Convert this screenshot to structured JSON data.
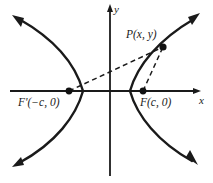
{
  "figure": {
    "kind": "hyperbola-focus-diagram",
    "background_color": "#ffffff",
    "stroke_color": "#1a1a1a",
    "axes": {
      "x_label": "x",
      "y_label": "y",
      "origin": {
        "x": 110,
        "y": 91
      },
      "x_axis": {
        "x_start": 10,
        "x_end": 200,
        "y": 91,
        "arrow": "right"
      },
      "y_axis": {
        "y_start": 5,
        "y_end": 176,
        "x": 110,
        "arrow": "up"
      }
    },
    "points": [
      {
        "id": "focus-left",
        "label": "F'(−c, 0)",
        "x": 69,
        "y": 91,
        "dot": true
      },
      {
        "id": "focus-right",
        "label": "F(c, 0)",
        "x": 143,
        "y": 91,
        "dot": true
      },
      {
        "id": "point-p",
        "label": "P(x, y)",
        "x": 163,
        "y": 47,
        "dot": true
      }
    ],
    "curves": [
      {
        "id": "left-branch",
        "vertex": {
          "x": 83,
          "y": 91
        },
        "arrow_tips": [
          {
            "x": 13,
            "y": 16
          },
          {
            "x": 13,
            "y": 166
          }
        ]
      },
      {
        "id": "right-branch",
        "vertex": {
          "x": 130,
          "y": 91
        },
        "arrow_tips": [
          {
            "x": 199,
            "y": 14
          },
          {
            "x": 197,
            "y": 164
          }
        ]
      }
    ],
    "segments": [
      {
        "id": "focal-radius-left",
        "from": "focus-left",
        "to": "point-p",
        "style": "dashed"
      },
      {
        "id": "focal-radius-right",
        "from": "focus-right",
        "to": "point-p",
        "style": "dashed"
      }
    ]
  }
}
